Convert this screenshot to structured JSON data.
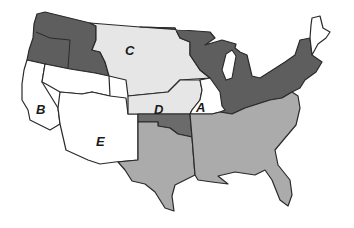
{
  "map": {
    "subject": "United States territorial map",
    "labels": [
      {
        "id": "A",
        "text": "A",
        "x": 196,
        "y": 101
      },
      {
        "id": "B",
        "text": "B",
        "x": 36,
        "y": 103
      },
      {
        "id": "C",
        "text": "C",
        "x": 125,
        "y": 44
      },
      {
        "id": "D",
        "text": "D",
        "x": 154,
        "y": 103
      },
      {
        "id": "E",
        "text": "E",
        "x": 96,
        "y": 135
      }
    ],
    "colors": {
      "dark_region": "#5e5e5e",
      "medium_region": "#ababab",
      "light_region": "#e6e6e6",
      "white_region": "#ffffff",
      "oklahoma_region": "#6b6b6b",
      "border": "#2a2a2a"
    }
  }
}
